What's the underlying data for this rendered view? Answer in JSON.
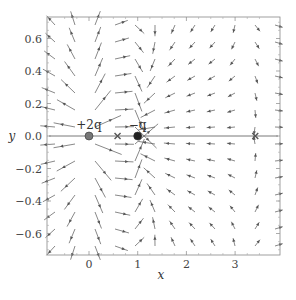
{
  "chart_data": {
    "type": "vector_field",
    "title": "",
    "xlabel": "x",
    "ylabel": "y",
    "xlim": [
      -0.8,
      3.8
    ],
    "ylim": [
      -0.74,
      0.74
    ],
    "x_ticks": [
      0,
      1,
      2,
      3
    ],
    "x_tick_labels": [
      "0",
      "1",
      "2",
      "3"
    ],
    "y_ticks": [
      0.6,
      0.4,
      0.2,
      0.0,
      -0.2,
      -0.4,
      -0.6
    ],
    "y_tick_labels": [
      "0.6",
      "0.4",
      "0.2",
      "0.0",
      "−0.2",
      "−0.4",
      "−0.6"
    ],
    "grid": false,
    "charges": [
      {
        "label": "+2q",
        "q": 2,
        "x": 0,
        "y": 0,
        "color": "#777777"
      },
      {
        "label": "−q",
        "q": -1,
        "x": 1,
        "y": 0,
        "color": "#222222"
      }
    ],
    "null_points": [
      {
        "x": 0.586,
        "y": 0,
        "marker": "x"
      },
      {
        "x": 3.414,
        "y": 0,
        "marker": "x"
      }
    ]
  },
  "colors": {
    "field": "#555555",
    "frame": "#888888",
    "text": "#444444"
  }
}
